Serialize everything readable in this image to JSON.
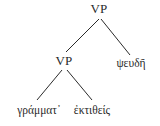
{
  "figure": {
    "type": "syntax-tree",
    "language": "Ancient Greek",
    "background_color": "#ffffff",
    "ink_color": "#2b2b2b",
    "width": 160,
    "height": 126
  },
  "tree": {
    "root": {
      "id": "vp-root",
      "label": "VP",
      "kind": "nonterminal",
      "x": 99,
      "y": 8
    },
    "nodes": [
      {
        "id": "vp-inner",
        "label": "VP",
        "kind": "nonterminal",
        "x": 64,
        "y": 60,
        "parent": "vp-root"
      },
      {
        "id": "pseude",
        "label": "ψευδῆ",
        "kind": "terminal",
        "x": 131,
        "y": 64,
        "parent": "vp-root"
      },
      {
        "id": "grammat",
        "label": "γράμματ᾽",
        "kind": "terminal",
        "x": 39,
        "y": 111,
        "parent": "vp-inner"
      },
      {
        "id": "ektitheis",
        "label": "ἐκτιθείς",
        "kind": "terminal",
        "x": 92,
        "y": 111,
        "parent": "vp-inner"
      }
    ],
    "edges": [
      {
        "id": "edge-root-left",
        "from": "vp-root",
        "to": "vp-inner",
        "x1": 99,
        "y1": 19,
        "x2": 66,
        "y2": 52
      },
      {
        "id": "edge-root-right",
        "from": "vp-root",
        "to": "pseude",
        "x1": 101,
        "y1": 19,
        "x2": 130,
        "y2": 55
      },
      {
        "id": "edge-inner-left",
        "from": "vp-inner",
        "to": "grammat",
        "x1": 62,
        "y1": 70,
        "x2": 37,
        "y2": 100
      },
      {
        "id": "edge-inner-right",
        "from": "vp-inner",
        "to": "ektitheis",
        "x1": 67,
        "y1": 70,
        "x2": 92,
        "y2": 100
      }
    ]
  }
}
